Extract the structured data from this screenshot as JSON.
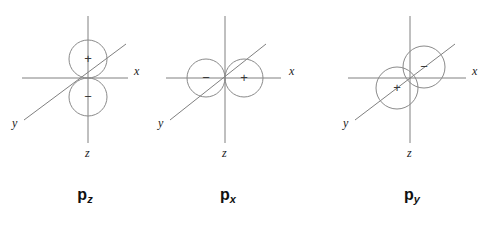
{
  "figure": {
    "background_color": "#ffffff",
    "axis_color": "#808080",
    "lobe_color": "#8a8a8a",
    "text_color": "#111111",
    "diagrams": [
      {
        "id": "pz",
        "caption_base": "p",
        "caption_sub": "z",
        "origin": {
          "x": 88,
          "y": 78
        },
        "axes": [
          {
            "name": "x",
            "label": "x",
            "label_x": 134,
            "label_y": 75,
            "x1": 22,
            "y1": 78,
            "x2": 128,
            "y2": 78
          },
          {
            "name": "y",
            "label": "y",
            "label_x": 12,
            "label_y": 127,
            "x1": 24,
            "y1": 120,
            "x2": 126,
            "y2": 44
          },
          {
            "name": "z",
            "label": "z",
            "label_x": 85,
            "label_y": 157,
            "x1": 88,
            "y1": 16,
            "x2": 88,
            "y2": 143
          }
        ],
        "lobes": [
          {
            "sign": "+",
            "cx": 88,
            "cy": 59,
            "r": 19,
            "sign_x": 88,
            "sign_y": 63
          },
          {
            "sign": "−",
            "cx": 88,
            "cy": 97,
            "r": 19,
            "sign_x": 88,
            "sign_y": 101
          }
        ]
      },
      {
        "id": "px",
        "caption_base": "p",
        "caption_sub": "x",
        "origin": {
          "x": 225,
          "y": 78
        },
        "axes": [
          {
            "name": "x",
            "label": "x",
            "label_x": 289,
            "label_y": 75,
            "x1": 166,
            "y1": 78,
            "x2": 281,
            "y2": 78
          },
          {
            "name": "y",
            "label": "y",
            "label_x": 158,
            "label_y": 127,
            "x1": 170,
            "y1": 120,
            "x2": 266,
            "y2": 44
          },
          {
            "name": "z",
            "label": "z",
            "label_x": 222,
            "label_y": 157,
            "x1": 225,
            "y1": 16,
            "x2": 225,
            "y2": 143
          }
        ],
        "lobes": [
          {
            "sign": "−",
            "cx": 206,
            "cy": 78,
            "r": 19,
            "sign_x": 206,
            "sign_y": 82
          },
          {
            "sign": "+",
            "cx": 244,
            "cy": 78,
            "r": 19,
            "sign_x": 244,
            "sign_y": 82
          }
        ]
      },
      {
        "id": "py",
        "caption_base": "p",
        "caption_sub": "y",
        "origin": {
          "x": 410,
          "y": 78
        },
        "axes": [
          {
            "name": "x",
            "label": "x",
            "label_x": 472,
            "label_y": 75,
            "x1": 348,
            "y1": 78,
            "x2": 466,
            "y2": 78
          },
          {
            "name": "y",
            "label": "y",
            "label_x": 343,
            "label_y": 127,
            "x1": 355,
            "y1": 120,
            "x2": 455,
            "y2": 44
          },
          {
            "name": "z",
            "label": "z",
            "label_x": 407,
            "label_y": 157,
            "x1": 410,
            "y1": 16,
            "x2": 410,
            "y2": 143
          }
        ],
        "lobes": [
          {
            "sign": "+",
            "cx": 397,
            "cy": 88,
            "r": 21,
            "sign_x": 397,
            "sign_y": 92
          },
          {
            "sign": "−",
            "cx": 424,
            "cy": 67,
            "r": 21,
            "sign_x": 424,
            "sign_y": 71
          }
        ]
      }
    ],
    "captions": [
      {
        "id": "caption-pz",
        "base": "p",
        "sub": "z",
        "x": 85,
        "y": 200
      },
      {
        "id": "caption-px",
        "base": "p",
        "sub": "x",
        "x": 228,
        "y": 200
      },
      {
        "id": "caption-py",
        "base": "p",
        "sub": "y",
        "x": 412,
        "y": 200
      }
    ]
  }
}
